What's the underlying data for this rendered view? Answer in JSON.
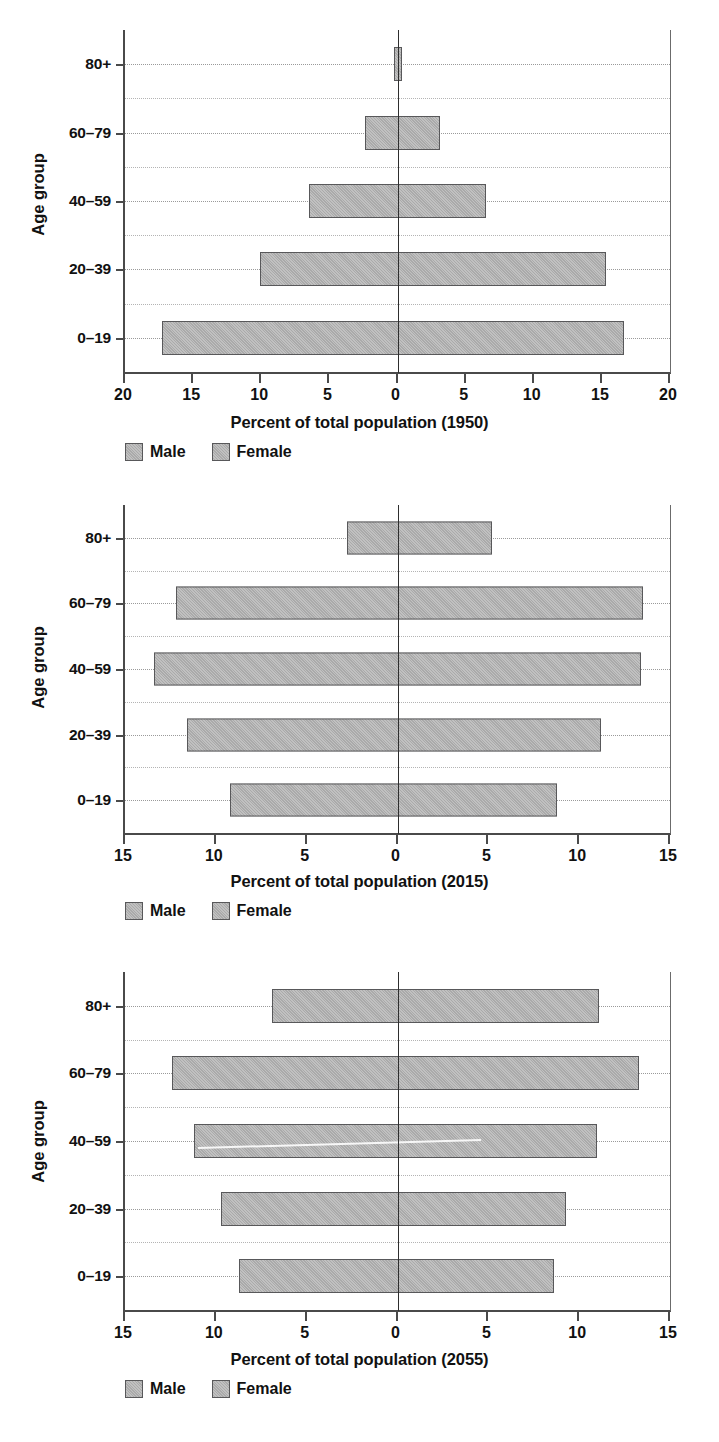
{
  "figure": {
    "kind": "population-pyramid-series",
    "panel_count": 3,
    "bar_fill_color": "#b3b3b3",
    "bar_edge_color": "#58585a",
    "grid_color": "#b4b4b4",
    "axis_color": "#4a4a4a"
  },
  "legend": {
    "male_label": "Male",
    "female_label": "Female"
  },
  "axis": {
    "y_title": "Age group"
  },
  "chart_data": [
    {
      "type": "bar",
      "subtype": "population-pyramid",
      "title": "",
      "xlabel": "Percent of total population (1950)",
      "ylabel": "Age group",
      "xlim": [
        -20,
        20
      ],
      "xtick_values": [
        -20,
        -15,
        -10,
        -5,
        0,
        5,
        10,
        15,
        20
      ],
      "xtick_labels": [
        "20",
        "15",
        "10",
        "5",
        "0",
        "5",
        "10",
        "15",
        "20"
      ],
      "categories": [
        "0–19",
        "20–39",
        "40–59",
        "60–79",
        "80+"
      ],
      "grid": true,
      "legend_position": "below-left",
      "series": [
        {
          "name": "Male",
          "side": "left",
          "values": [
            17.3,
            10.1,
            6.5,
            2.4,
            0.25
          ]
        },
        {
          "name": "Female",
          "side": "right",
          "values": [
            16.6,
            15.3,
            6.5,
            3.1,
            0.3
          ]
        }
      ]
    },
    {
      "type": "bar",
      "subtype": "population-pyramid",
      "title": "",
      "xlabel": "Percent of total population (2015)",
      "ylabel": "Age group",
      "xlim": [
        -15,
        15
      ],
      "xtick_values": [
        -15,
        -10,
        -5,
        0,
        5,
        10,
        15
      ],
      "xtick_labels": [
        "15",
        "10",
        "5",
        "0",
        "5",
        "10",
        "15"
      ],
      "categories": [
        "0–19",
        "20–39",
        "40–59",
        "60–79",
        "80+"
      ],
      "grid": true,
      "legend_position": "below-left",
      "series": [
        {
          "name": "Male",
          "side": "left",
          "values": [
            9.2,
            11.6,
            13.4,
            12.2,
            2.8
          ]
        },
        {
          "name": "Female",
          "side": "right",
          "values": [
            8.8,
            11.2,
            13.4,
            13.5,
            5.2
          ]
        }
      ]
    },
    {
      "type": "bar",
      "subtype": "population-pyramid",
      "title": "",
      "xlabel": "Percent of total population (2055)",
      "ylabel": "Age group",
      "xlim": [
        -15,
        15
      ],
      "xtick_values": [
        -15,
        -10,
        -5,
        0,
        5,
        10,
        15
      ],
      "xtick_labels": [
        "15",
        "10",
        "5",
        "0",
        "5",
        "10",
        "15"
      ],
      "categories": [
        "0–19",
        "20–39",
        "40–59",
        "60–79",
        "80+"
      ],
      "grid": true,
      "legend_position": "below-left",
      "series": [
        {
          "name": "Male",
          "side": "left",
          "values": [
            8.7,
            9.7,
            11.2,
            12.4,
            6.9
          ]
        },
        {
          "name": "Female",
          "side": "right",
          "values": [
            8.6,
            9.3,
            11.0,
            13.3,
            11.1
          ]
        }
      ]
    }
  ]
}
